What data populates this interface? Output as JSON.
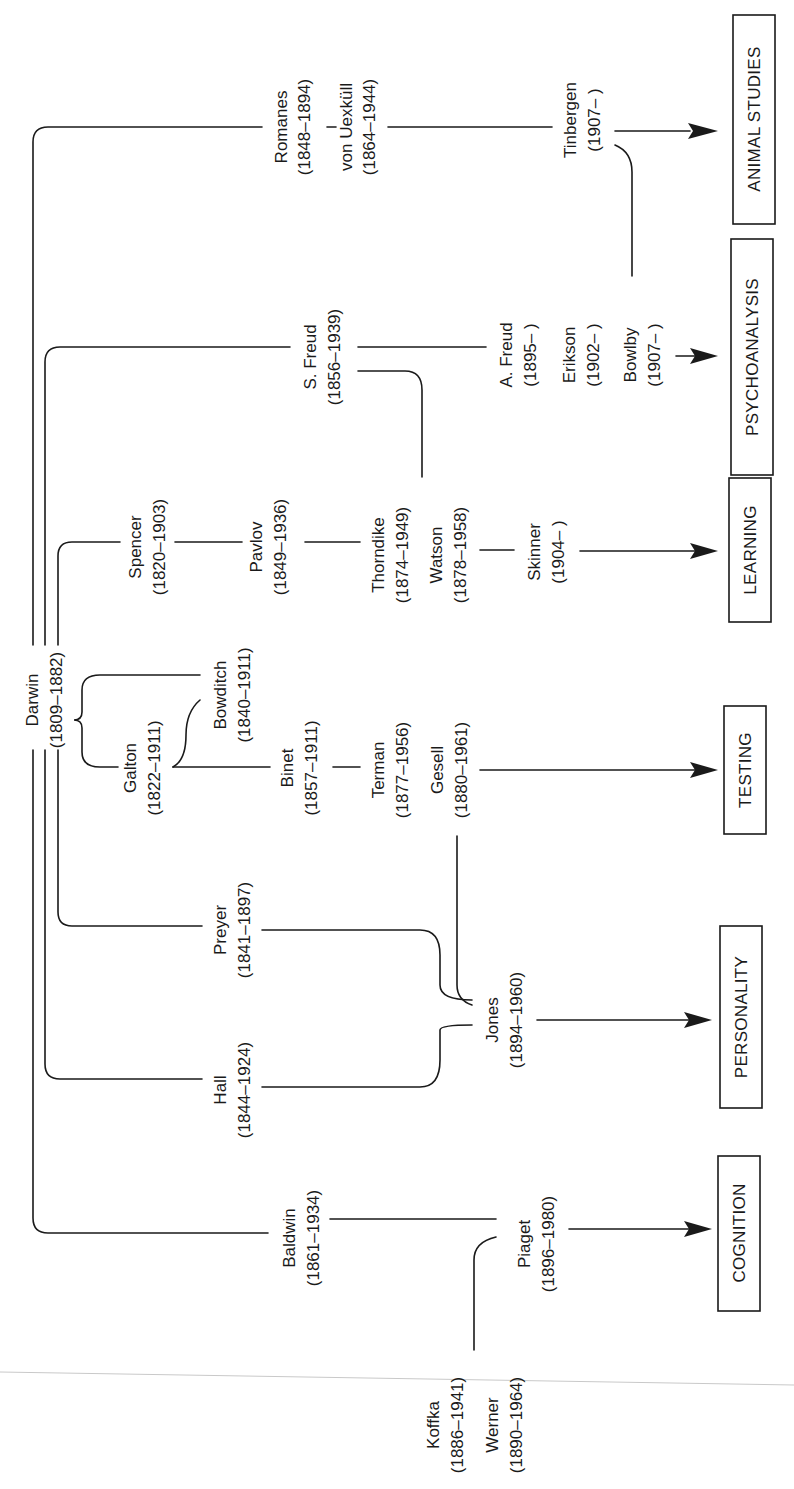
{
  "diagram": {
    "orientation": "rotated-90-ccw",
    "colors": {
      "ink": "#1a1a1a",
      "paper": "#ffffff"
    },
    "root": {
      "name": "Darwin",
      "dates": "(1809–1882)"
    },
    "people": {
      "romanes": {
        "name": "Romanes",
        "dates": "(1848–1894)"
      },
      "uexkull": {
        "name": "von Uexküll",
        "dates": "(1864–1944)"
      },
      "tinbergen": {
        "name": "Tinbergen",
        "dates": "(1907–      )"
      },
      "sfreud": {
        "name": "S. Freud",
        "dates": "(1856–1939)"
      },
      "afreud": {
        "name": "A. Freud",
        "dates": "(1895–      )"
      },
      "erikson": {
        "name": "Erikson",
        "dates": "(1902–      )"
      },
      "bowlby": {
        "name": "Bowlby",
        "dates": "(1907–      )"
      },
      "spencer": {
        "name": "Spencer",
        "dates": "(1820–1903)"
      },
      "pavlov": {
        "name": "Pavlov",
        "dates": "(1849–1936)"
      },
      "thorndike": {
        "name": "Thorndike",
        "dates": "(1874–1949)"
      },
      "watson": {
        "name": "Watson",
        "dates": "(1878–1958)"
      },
      "skinner": {
        "name": "Skinner",
        "dates": "(1904–      )"
      },
      "bowditch": {
        "name": "Bowditch",
        "dates": "(1840–1911)"
      },
      "galton": {
        "name": "Galton",
        "dates": "(1822–1911)"
      },
      "binet": {
        "name": "Binet",
        "dates": "(1857–1911)"
      },
      "terman": {
        "name": "Terman",
        "dates": "(1877–1956)"
      },
      "gesell": {
        "name": "Gesell",
        "dates": "(1880–1961)"
      },
      "preyer": {
        "name": "Preyer",
        "dates": "(1841–1897)"
      },
      "hall": {
        "name": "Hall",
        "dates": "(1844–1924)"
      },
      "jones": {
        "name": "Jones",
        "dates": "(1894–1960)"
      },
      "baldwin": {
        "name": "Baldwin",
        "dates": "(1861–1934)"
      },
      "piaget": {
        "name": "Piaget",
        "dates": "(1896–1980)"
      },
      "koffka": {
        "name": "Koffka",
        "dates": "(1886–1941)"
      },
      "werner": {
        "name": "Werner",
        "dates": "(1890–1964)"
      }
    },
    "categories": {
      "animal_studies": "ANIMAL STUDIES",
      "psychoanalysis": "PSYCHOANALYSIS",
      "learning": "LEARNING",
      "testing": "TESTING",
      "personality": "PERSONALITY",
      "cognition": "COGNITION"
    },
    "connections": [
      [
        "Darwin",
        "Romanes"
      ],
      [
        "Romanes",
        "von Uexküll"
      ],
      [
        "von Uexküll",
        "Tinbergen"
      ],
      [
        "Tinbergen",
        "ANIMAL STUDIES"
      ],
      [
        "Tinbergen",
        "Bowlby"
      ],
      [
        "Darwin",
        "S. Freud"
      ],
      [
        "S. Freud",
        "A. Freud"
      ],
      [
        "S. Freud",
        "Thorndike"
      ],
      [
        "A. Freud",
        "PSYCHOANALYSIS"
      ],
      [
        "Darwin",
        "Spencer"
      ],
      [
        "Spencer",
        "Pavlov"
      ],
      [
        "Pavlov",
        "Thorndike"
      ],
      [
        "Watson",
        "Skinner"
      ],
      [
        "Skinner",
        "LEARNING"
      ],
      [
        "Darwin",
        "Bowditch"
      ],
      [
        "Darwin",
        "Galton"
      ],
      [
        "Galton",
        "Bowditch"
      ],
      [
        "Galton",
        "Binet"
      ],
      [
        "Binet",
        "Terman"
      ],
      [
        "Gesell",
        "TESTING"
      ],
      [
        "Darwin",
        "Preyer"
      ],
      [
        "Darwin",
        "Hall"
      ],
      [
        "Preyer",
        "Jones"
      ],
      [
        "Hall",
        "Jones"
      ],
      [
        "Gesell",
        "Jones"
      ],
      [
        "Jones",
        "PERSONALITY"
      ],
      [
        "Darwin",
        "Baldwin"
      ],
      [
        "Baldwin",
        "Piaget"
      ],
      [
        "Koffka",
        "Piaget"
      ],
      [
        "Werner",
        "Piaget"
      ],
      [
        "Piaget",
        "COGNITION"
      ]
    ]
  }
}
